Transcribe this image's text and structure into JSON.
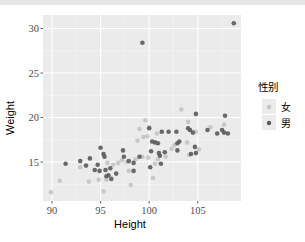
{
  "chart_data": {
    "type": "scatter",
    "title": "",
    "xlabel": "Height",
    "ylabel": "Weight",
    "xlim": [
      89.1,
      109.5
    ],
    "ylim": [
      10.6,
      31.5
    ],
    "xticks": [
      90,
      95,
      100,
      105
    ],
    "yticks": [
      15,
      20,
      25,
      30
    ],
    "grid": true,
    "legend": {
      "title": "性别",
      "position": "right"
    },
    "series": [
      {
        "name": "女",
        "color": "#c4c4c4",
        "points": [
          [
            89.9,
            11.6
          ],
          [
            90.8,
            12.9
          ],
          [
            92.9,
            14.4
          ],
          [
            93.8,
            12.8
          ],
          [
            94.8,
            13.0
          ],
          [
            95.3,
            11.7
          ],
          [
            95.6,
            13.0
          ],
          [
            95.7,
            14.9
          ],
          [
            96.3,
            14.7
          ],
          [
            96.8,
            14.9
          ],
          [
            97.2,
            15.2
          ],
          [
            97.7,
            15.0
          ],
          [
            97.9,
            14.0
          ],
          [
            98.1,
            12.4
          ],
          [
            98.6,
            15.3
          ],
          [
            98.8,
            17.4
          ],
          [
            99.0,
            18.7
          ],
          [
            99.4,
            17.8
          ],
          [
            99.6,
            19.7
          ],
          [
            99.8,
            17.9
          ],
          [
            99.3,
            15.6
          ],
          [
            99.9,
            15.5
          ],
          [
            100.0,
            18.9
          ],
          [
            100.4,
            13.2
          ],
          [
            100.6,
            14.8
          ],
          [
            100.8,
            18.2
          ],
          [
            100.9,
            15.3
          ],
          [
            101.7,
            15.6
          ],
          [
            102.3,
            16.5
          ],
          [
            102.6,
            16.9
          ],
          [
            103.3,
            20.9
          ],
          [
            104.0,
            19.5
          ],
          [
            103.9,
            17.2
          ],
          [
            104.1,
            15.8
          ],
          [
            105.1,
            16.4
          ],
          [
            106.3,
            18.9
          ],
          [
            107.7,
            19.2
          ],
          [
            104.8,
            18.4
          ]
        ]
      },
      {
        "name": "男",
        "color": "#5a5a5a",
        "points": [
          [
            91.4,
            14.8
          ],
          [
            92.9,
            15.1
          ],
          [
            93.5,
            14.6
          ],
          [
            93.9,
            15.4
          ],
          [
            94.4,
            14.1
          ],
          [
            94.7,
            14.7
          ],
          [
            94.9,
            14.0
          ],
          [
            95.0,
            16.6
          ],
          [
            95.3,
            15.9
          ],
          [
            95.4,
            15.6
          ],
          [
            95.5,
            14.1
          ],
          [
            95.6,
            13.4
          ],
          [
            95.8,
            13.5
          ],
          [
            96.0,
            14.3
          ],
          [
            96.1,
            13.1
          ],
          [
            96.6,
            13.7
          ],
          [
            97.3,
            16.3
          ],
          [
            97.4,
            15.6
          ],
          [
            97.9,
            15.1
          ],
          [
            98.4,
            14.9
          ],
          [
            98.4,
            14.0
          ],
          [
            99.0,
            15.6
          ],
          [
            99.3,
            28.4
          ],
          [
            100.0,
            18.8
          ],
          [
            100.1,
            14.4
          ],
          [
            100.2,
            16.2
          ],
          [
            100.3,
            17.3
          ],
          [
            100.6,
            17.2
          ],
          [
            100.9,
            17.1
          ],
          [
            101.0,
            16.0
          ],
          [
            101.1,
            15.7
          ],
          [
            101.2,
            14.8
          ],
          [
            101.3,
            18.4
          ],
          [
            101.6,
            16.1
          ],
          [
            102.0,
            18.4
          ],
          [
            102.8,
            18.4
          ],
          [
            102.9,
            16.3
          ],
          [
            102.9,
            17.1
          ],
          [
            103.1,
            17.3
          ],
          [
            104.0,
            18.8
          ],
          [
            104.2,
            18.6
          ],
          [
            104.3,
            15.9
          ],
          [
            104.5,
            18.3
          ],
          [
            104.7,
            16.7
          ],
          [
            104.8,
            20.4
          ],
          [
            104.8,
            16.0
          ],
          [
            106.0,
            18.6
          ],
          [
            107.0,
            18.2
          ],
          [
            107.5,
            18.6
          ],
          [
            107.7,
            18.3
          ],
          [
            107.8,
            20.2
          ],
          [
            108.1,
            18.2
          ],
          [
            108.7,
            30.6
          ]
        ]
      }
    ]
  },
  "legend": {
    "title": "性别",
    "items": [
      {
        "label": "女",
        "color": "#c4c4c4"
      },
      {
        "label": "男",
        "color": "#5a5a5a"
      }
    ]
  },
  "axes": {
    "x_label": "Height",
    "y_label": "Weight",
    "x_ticks": [
      "90",
      "95",
      "100",
      "105"
    ],
    "y_ticks": [
      "15",
      "20",
      "25",
      "30"
    ]
  },
  "colors": {
    "panel_bg": "#ebebeb",
    "grid": "#ffffff",
    "tick_text": "#4d4d4d",
    "axis_title": "#000000"
  }
}
